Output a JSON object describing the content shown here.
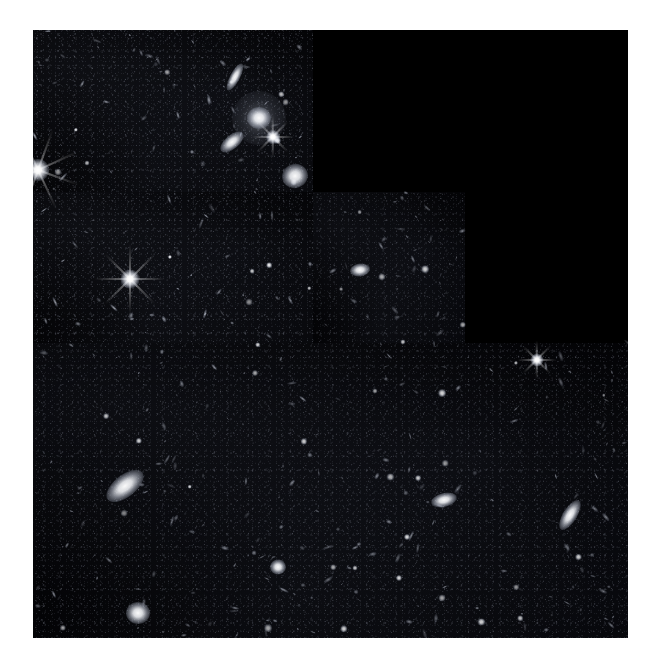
{
  "image": {
    "title": "Hubble Deep Field WFPC2 mosaic",
    "alt_text": "Deep field astronomical exposure showing hundreds of faint distant galaxies and a few foreground stars on a black sky, arranged in an L-shaped three-chip detector mosaic with one empty quadrant.",
    "canvas_width": 653,
    "canvas_height": 672,
    "margin_color": "#ffffff",
    "sky_color": "#040406",
    "void_color": "#000000",
    "source_color": "#ffffff"
  },
  "mosaic": {
    "frame": {
      "left": 33,
      "top": 30,
      "width": 595,
      "height": 608
    },
    "layout_name": "stair-step-L",
    "chips": [
      {
        "name": "chip-upper-left",
        "label": "WF2",
        "left": 0,
        "top": 0,
        "width": 280,
        "height": 162,
        "brightness": 1.0
      },
      {
        "name": "chip-left-column",
        "label": "WF3",
        "left": 0,
        "top": 162,
        "width": 280,
        "height": 151,
        "brightness": 0.95
      },
      {
        "name": "chip-middle",
        "label": "PC1",
        "left": 280,
        "top": 162,
        "width": 152,
        "height": 151,
        "brightness": 0.8
      },
      {
        "name": "chip-bottom",
        "label": "WF4",
        "left": 0,
        "top": 313,
        "width": 595,
        "height": 295,
        "brightness": 0.85
      }
    ],
    "void_regions": [
      {
        "name": "void-upper-right",
        "left": 280,
        "top": 0,
        "width": 315,
        "height": 162
      },
      {
        "name": "void-right-middle",
        "left": 432,
        "top": 162,
        "width": 163,
        "height": 151
      }
    ]
  },
  "objects": {
    "bright_stars": [
      {
        "name": "diffraction-star-west-edge",
        "x": 5,
        "y": 140,
        "size": 22,
        "spike_len": 86,
        "spike_w": 2.2,
        "rotation": 20,
        "arms": 4
      },
      {
        "name": "diffraction-star-mid-left",
        "x": 97,
        "y": 249,
        "size": 19,
        "spike_len": 70,
        "spike_w": 2.0,
        "rotation": 0,
        "arms": 4
      },
      {
        "name": "diffraction-star-upper-right",
        "x": 240,
        "y": 107,
        "size": 14,
        "spike_len": 42,
        "spike_w": 1.6,
        "rotation": 0,
        "arms": 4
      },
      {
        "name": "diffraction-star-bottom-right",
        "x": 504,
        "y": 330,
        "size": 13,
        "spike_len": 38,
        "spike_w": 1.5,
        "rotation": 0,
        "arms": 4
      }
    ],
    "bright_galaxies": [
      {
        "name": "spiral-galaxy-bright-lowleft",
        "x": 92,
        "y": 456,
        "w": 44,
        "h": 22,
        "rotation": -38
      },
      {
        "name": "edge-on-galaxy-right",
        "x": 537,
        "y": 485,
        "w": 34,
        "h": 14,
        "rotation": -58
      },
      {
        "name": "elliptical-galaxy-halo-top",
        "x": 226,
        "y": 88,
        "w": 24,
        "h": 22,
        "rotation": 0,
        "halo": 54
      },
      {
        "name": "spindle-galaxy-top",
        "x": 202,
        "y": 47,
        "w": 30,
        "h": 10,
        "rotation": -62
      },
      {
        "name": "elongated-galaxy-upleft",
        "x": 199,
        "y": 112,
        "w": 28,
        "h": 14,
        "rotation": -40
      },
      {
        "name": "corner-blob-galaxy",
        "x": 262,
        "y": 146,
        "w": 26,
        "h": 24,
        "rotation": -20
      },
      {
        "name": "galaxy-pair-bottom-left",
        "x": 105,
        "y": 583,
        "w": 24,
        "h": 22,
        "rotation": 0
      },
      {
        "name": "galaxy-group-center-bottom",
        "x": 411,
        "y": 470,
        "w": 26,
        "h": 14,
        "rotation": -14
      },
      {
        "name": "bright-galaxy-mid-chip",
        "x": 327,
        "y": 240,
        "w": 20,
        "h": 13,
        "rotation": -8
      },
      {
        "name": "compact-galaxy-bottom-center",
        "x": 245,
        "y": 537,
        "w": 16,
        "h": 15,
        "rotation": 0
      }
    ],
    "field_galaxy_count": 320,
    "field_star_count": 46
  },
  "overlay": {
    "visible": false,
    "scalebar_label": "",
    "compass_label": ""
  }
}
